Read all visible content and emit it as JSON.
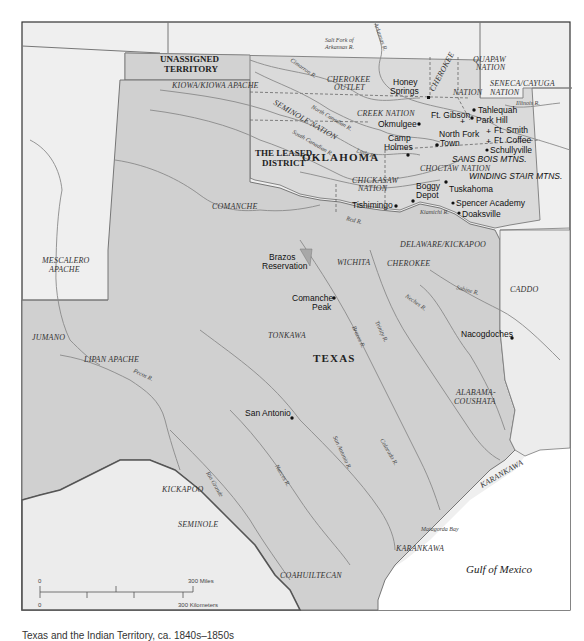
{
  "map": {
    "caption": "Texas and the Indian Territory, ca. 1840s–1850s",
    "state_labels": {
      "oklahoma": "OKLAHOMA",
      "texas": "TEXAS"
    },
    "region_labels": {
      "unassigned_territory_1": "UNASSIGNED",
      "unassigned_territory_2": "TERRITORY",
      "leased_district_1": "THE LEASED",
      "leased_district_2": "DISTRICT"
    },
    "tribal_labels": {
      "kiowa": "KIOWA/KIOWA APACHE",
      "cherokee_outlet_1": "CHEROKEE",
      "cherokee_outlet_2": "OUTLET",
      "cherokee_nation": "CHEROKEE",
      "nation_suffix": "NATION",
      "quapaw_1": "QUAPAW",
      "quapaw_2": "NATION",
      "seneca_1": "SENECA/CAYUGA",
      "seneca_2": "NATION",
      "seminole_nation": "SEMINOLE NATION",
      "creek_nation": "CREEK NATION",
      "chickasaw_1": "CHICKASAW",
      "chickasaw_2": "NATION",
      "choctaw_nation": "CHOCTAW NATION",
      "comanche": "COMANCHE",
      "mescalero_1": "MESCALERO",
      "mescalero_2": "APACHE",
      "delaware_kickapoo": "DELAWARE/KICKAPOO",
      "wichita": "WICHITA",
      "cherokee_tx": "CHEROKEE",
      "caddo": "CADDO",
      "jumano": "JUMANO",
      "lipan_apache": "LIPAN APACHE",
      "tonkawa": "TONKAWA",
      "alabama_1": "ALABAMA-",
      "alabama_2": "COUSHATA",
      "kickapoo": "KICKAPOO",
      "seminole_tx": "SEMINOLE",
      "coahuiltecan": "COAHUILTECAN",
      "karankawa_1": "KARANKAWA",
      "karankawa_2": "KARANKAWA"
    },
    "towns": {
      "honey_springs_1": "Honey",
      "honey_springs_2": "Springs",
      "tahlequah": "Tahlequah",
      "park_hill": "Park Hill",
      "ft_gibson": "Ft. Gibson",
      "okmulgee": "Okmulgee",
      "north_fork_1": "North Fork",
      "north_fork_2": "Town",
      "ft_smith": "Ft. Smith",
      "ft_coffee": "Ft. Coffee",
      "schullyville": "Schullyville",
      "camp_holmes_1": "Camp",
      "camp_holmes_2": "Holmes",
      "boggy_depot_1": "Boggy",
      "boggy_depot_2": "Depot",
      "tuskahoma": "Tuskahoma",
      "spencer_academy": "Spencer Academy",
      "doaksville": "Doaksville",
      "tishimingo": "Tishimingo",
      "brazos_reservation_1": "Brazos",
      "brazos_reservation_2": "Reservation",
      "comanche_peak_1": "Comanche",
      "comanche_peak_2": "Peak",
      "nacogdoches": "Nacogdoches",
      "san_antonio": "San Antonio"
    },
    "mountains": {
      "sans_bois": "SANS BOIS MTNS.",
      "winding_stair": "WINDING STAIR MTNS."
    },
    "rivers": {
      "salt_fork_1": "Salt Fork of",
      "salt_fork_2": "Arkansas R.",
      "arkansas": "Arkansas R.",
      "cimarron": "Cimarron R.",
      "north_canadian": "North Canadian R.",
      "south_canadian": "South Canadian R.",
      "little": "Little R.",
      "red": "Red R.",
      "illinois": "Illinois R.",
      "kiamichi": "Kiamichi R.",
      "sabine": "Sabine R.",
      "neches": "Neches R.",
      "trinity": "Trinity R.",
      "brazos": "Brazos R.",
      "colorado": "Colorado R.",
      "san_antonio": "San Antonio R.",
      "nueces": "Nueces R.",
      "rio_grande": "Rio Grande",
      "pecos": "Pecos R."
    },
    "water_bodies": {
      "gulf": "Gulf of Mexico",
      "matagorda": "Matagorda Bay"
    },
    "scale": {
      "miles_zero": "0",
      "miles_max": "300 Miles",
      "km_zero": "0",
      "km_max": "300 Kilometers"
    },
    "colors": {
      "background_land": "#eeeeee",
      "territory_fill": "#d9d9d9",
      "texas_fill": "#cfcfcf",
      "sea": "#ffffff",
      "reservation_fill": "#a8a8a8",
      "river": "#8a8a8a"
    }
  }
}
